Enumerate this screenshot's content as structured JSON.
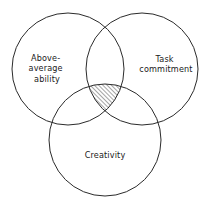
{
  "diagram": {
    "type": "venn",
    "background_color": "#ffffff",
    "stroke_color": "#2b2b2b",
    "text_color": "#1a1a1a",
    "hatch_color": "#2b2b2b",
    "hatch_angle_deg": 45,
    "hatch_spacing_px": 3,
    "circles": [
      {
        "id": "ability",
        "name": "above-average-ability-circle",
        "cx": 68,
        "cy": 69,
        "r": 56,
        "label_lines": [
          "Above-",
          "average",
          "ability"
        ],
        "label_x": 47,
        "label_y": 68
      },
      {
        "id": "task",
        "name": "task-commitment-circle",
        "cx": 142,
        "cy": 69,
        "r": 56,
        "label_lines": [
          "Task",
          "commitment"
        ],
        "label_x": 166,
        "label_y": 64
      },
      {
        "id": "creativity",
        "name": "creativity-circle",
        "cx": 105,
        "cy": 140,
        "r": 56,
        "label_lines": [
          "Creativity"
        ],
        "label_x": 105,
        "label_y": 155
      }
    ],
    "intersection": {
      "name": "triple-intersection-region",
      "label": "",
      "shaded": true,
      "fill_pattern": "diagonal-hatch"
    },
    "labels": {
      "ability_line1": "Above-",
      "ability_line2": "average",
      "ability_line3": "ability",
      "task_line1": "Task",
      "task_line2": "commitment",
      "creativity_line1": "Creativity"
    }
  }
}
